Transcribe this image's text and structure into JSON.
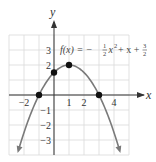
{
  "chart_data": {
    "type": "line",
    "title": "",
    "function_label": {
      "prefix": "f(x) = −",
      "frac1_num": "1",
      "frac1_den": "2",
      "middle": "x",
      "exp": "2",
      "tail": " + x + ",
      "frac2_num": "3",
      "frac2_den": "2"
    },
    "equation": "f(x) = -1/2 x^2 + x + 3/2",
    "xlabel": "x",
    "ylabel": "y",
    "xlim": [
      -3,
      5
    ],
    "ylim": [
      -4,
      4
    ],
    "grid": true,
    "x_ticks": [
      {
        "value": -2,
        "label": "−2"
      },
      {
        "value": 1,
        "label": "1"
      },
      {
        "value": 2,
        "label": "2"
      },
      {
        "value": 4,
        "label": "4"
      }
    ],
    "y_ticks": [
      {
        "value": 3,
        "label": "3"
      },
      {
        "value": 2,
        "label": "2"
      },
      {
        "value": -1,
        "label": "−1"
      },
      {
        "value": -2,
        "label": "−2"
      },
      {
        "value": -3,
        "label": "−3"
      }
    ],
    "series": [
      {
        "name": "f(x)",
        "x": [
          -2.45,
          -2,
          -1,
          0,
          1,
          2,
          3,
          4,
          4.45
        ],
        "y": [
          -4.35,
          -2.5,
          0,
          1.5,
          2,
          1.5,
          0,
          -2.5,
          -4.35
        ]
      }
    ],
    "highlighted_points": [
      {
        "x": -1,
        "y": 0
      },
      {
        "x": 0,
        "y": 1.5
      },
      {
        "x": 1,
        "y": 2
      },
      {
        "x": 3,
        "y": 0
      }
    ],
    "colors": {
      "curve": "#7a7a7a",
      "grid": "#d9d9d9",
      "axis": "#333333",
      "points": "#111111"
    }
  }
}
